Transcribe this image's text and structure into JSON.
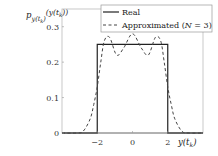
{
  "chart_data": {
    "type": "line",
    "title": "",
    "xlabel": "y(t_k)",
    "ylabel": "p_{y(t_k)}(y(t_k))",
    "xlim": [
      -4,
      4
    ],
    "ylim": [
      0,
      0.35
    ],
    "xticks": [
      -2,
      0,
      2
    ],
    "yticks": [
      0,
      0.1,
      0.2,
      0.3
    ],
    "xtick_labels": [
      "−2",
      "0",
      "2"
    ],
    "ytick_labels": [
      "0",
      "0.1",
      "0.2",
      "0.3"
    ],
    "grid": false,
    "legend_position": "upper right",
    "series": [
      {
        "name": "Real",
        "style": "solid",
        "color": "#222222",
        "x": [
          -4,
          -2,
          -2,
          2,
          2,
          4
        ],
        "y": [
          0,
          0,
          0.25,
          0.25,
          0,
          0
        ]
      },
      {
        "name": "Approximated (N = 3)",
        "style": "dashed",
        "color": "#444444",
        "x": [
          -4,
          -3.2,
          -2.8,
          -2.4,
          -2.2,
          -2.0,
          -1.8,
          -1.6,
          -1.3,
          -0.9,
          -0.5,
          0,
          0.5,
          0.9,
          1.3,
          1.6,
          1.8,
          2.0,
          2.2,
          2.4,
          2.8,
          3.2,
          4
        ],
        "y": [
          0,
          0,
          0.005,
          0.04,
          0.08,
          0.13,
          0.2,
          0.26,
          0.27,
          0.22,
          0.24,
          0.28,
          0.24,
          0.22,
          0.27,
          0.26,
          0.2,
          0.13,
          0.08,
          0.04,
          0.005,
          0,
          0
        ]
      }
    ]
  },
  "axes": {
    "xlabel_main": "y(t",
    "xlabel_sub": "k",
    "xlabel_close": ")",
    "ylabel_p": "p",
    "ylabel_sub": "y(t",
    "ylabel_subsub": "k",
    "ylabel_sub_close": ")",
    "ylabel_arg": "(y(t",
    "ylabel_arg_sub": "k",
    "ylabel_arg_close": "))"
  },
  "legend": {
    "items": [
      {
        "label": "Real"
      },
      {
        "label_prefix": "Approximated (",
        "label_var": "N",
        "label_suffix": " = 3)"
      }
    ]
  }
}
